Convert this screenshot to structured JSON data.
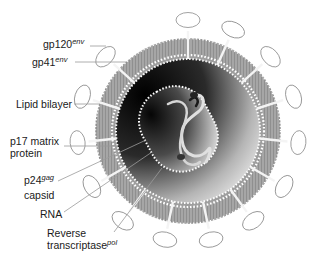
{
  "labels": [
    {
      "id": "gp120",
      "text": "gp120",
      "sup": "env"
    },
    {
      "id": "gp41",
      "text": "gp41",
      "sup": "env"
    },
    {
      "id": "lipid",
      "text": "Lipid bilayer"
    },
    {
      "id": "p17_line1",
      "text": "p17 matrix"
    },
    {
      "id": "p17_line2",
      "text": "protein"
    },
    {
      "id": "p24",
      "text": "p24",
      "sup": "gag"
    },
    {
      "id": "capsid",
      "text": "capsid"
    },
    {
      "id": "rna",
      "text": "RNA"
    },
    {
      "id": "rt_line1",
      "text": "Reverse"
    },
    {
      "id": "rt_line2",
      "text": "transcriptase",
      "sup": "pol"
    }
  ],
  "colors": {
    "envelope": "#a8a8a8",
    "envelope_dark": "#8c8c8c",
    "leader_line": "#9a9a9a",
    "core_dark": "#111111",
    "core_light": "#e6e6e6",
    "dots": "#ffffff",
    "text": "#1a1a1a"
  }
}
